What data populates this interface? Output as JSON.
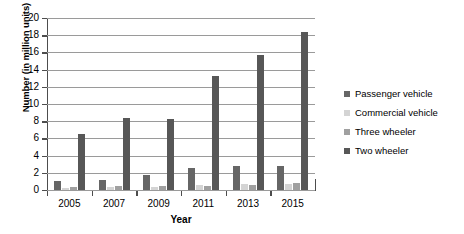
{
  "chart_data": {
    "type": "bar",
    "title": "",
    "xlabel": "Year",
    "ylabel": "Number (in million units)",
    "categories": [
      "2005",
      "2007",
      "2009",
      "2011",
      "2013",
      "2015"
    ],
    "series": [
      {
        "name": "Passenger vehicle",
        "color": "#666666",
        "values": [
          1.1,
          1.2,
          1.7,
          2.6,
          2.8,
          2.8
        ]
      },
      {
        "name": "Commercial vehicle",
        "color": "#d4d4d4",
        "values": [
          0.25,
          0.35,
          0.3,
          0.6,
          0.7,
          0.7
        ]
      },
      {
        "name": "Three wheeler",
        "color": "#a0a0a0",
        "values": [
          0.35,
          0.5,
          0.45,
          0.5,
          0.55,
          0.85
        ]
      },
      {
        "name": "Two wheeler",
        "color": "#575757",
        "values": [
          6.5,
          8.4,
          8.3,
          13.2,
          15.7,
          18.4
        ]
      }
    ],
    "ylim": [
      0,
      20
    ],
    "yticks": [
      0,
      2,
      4,
      6,
      8,
      10,
      12,
      14,
      16,
      18,
      20
    ],
    "ytick_labels": [
      "0",
      "2",
      "4",
      "6",
      "8",
      "10",
      "12",
      "14",
      "16",
      "18",
      "20"
    ],
    "grid": "horizontal",
    "legend_position": "right",
    "legend_entries": [
      "Passenger vehicle",
      "Commercial vehicle",
      "Three wheeler",
      "Two wheeler"
    ]
  }
}
